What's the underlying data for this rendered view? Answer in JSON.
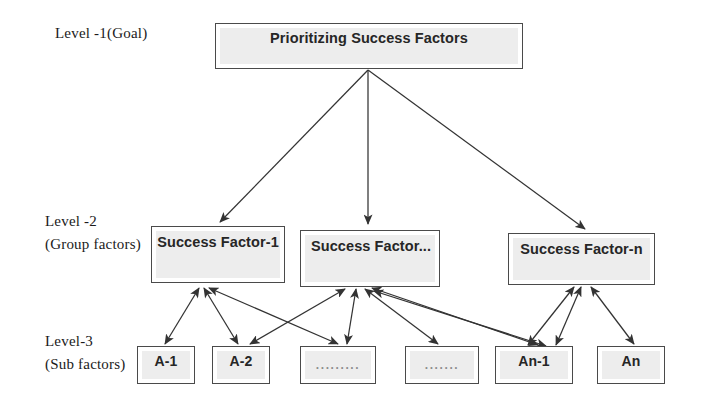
{
  "diagram": {
    "title_text": "Prioritizing Success Factors",
    "levels": [
      {
        "id": "level-1",
        "label": "Level -1(Goal)"
      },
      {
        "id": "level-2",
        "label": "Level -2\n(Group factors)"
      },
      {
        "id": "level-3",
        "label": "Level-3\n(Sub factors)"
      }
    ],
    "goal": {
      "label": "Prioritizing Success Factors"
    },
    "group_factors": [
      {
        "id": "sf-1",
        "label": "Success Factor-1"
      },
      {
        "id": "sf-mid",
        "label": "Success Factor..."
      },
      {
        "id": "sf-n",
        "label": "Success Factor-n"
      }
    ],
    "sub_factors": [
      {
        "id": "a-1",
        "label": "A-1"
      },
      {
        "id": "a-2",
        "label": "A-2"
      },
      {
        "id": "dots-1",
        "label": "........."
      },
      {
        "id": "dots-2",
        "label": "......."
      },
      {
        "id": "an-1",
        "label": "An-1"
      },
      {
        "id": "an",
        "label": "An"
      }
    ],
    "colors": {
      "box_border": "#4a4a4a",
      "box_fill": "#ededed",
      "arrow": "#333333",
      "text": "#262626",
      "label_text": "#1a1a1a",
      "background": "#ffffff"
    },
    "edge_style": {
      "goal_to_group": "single-headed arrow",
      "group_to_sub": "double-headed arrow"
    }
  }
}
